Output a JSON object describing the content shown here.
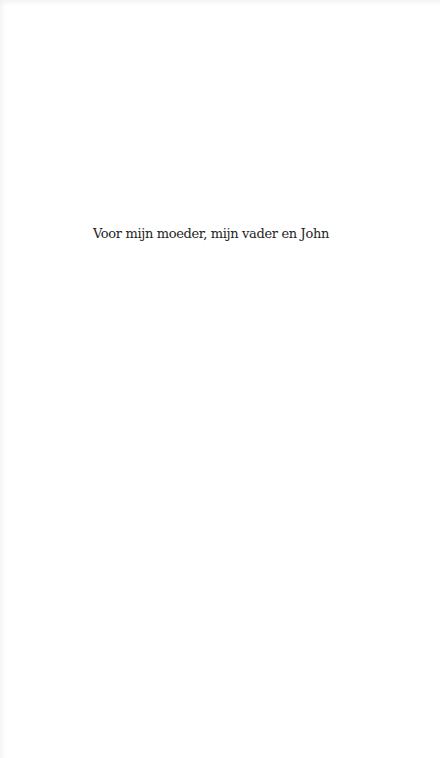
{
  "page": {
    "type": "dedication",
    "background_color": "#ffffff",
    "text_color": "#1e1e1e"
  },
  "dedication": {
    "text": "Voor mijn moeder, mijn vader en John"
  }
}
